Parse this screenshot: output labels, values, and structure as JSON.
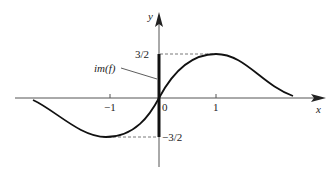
{
  "figure": {
    "axes": {
      "x_label": "x",
      "y_label": "y",
      "x_ticks": [
        {
          "value": -1,
          "label": "−1"
        },
        {
          "value": 0,
          "label": "0"
        },
        {
          "value": 1,
          "label": "1"
        }
      ],
      "y_ticks": [
        {
          "value": 1.5,
          "label": "3/2"
        },
        {
          "value": -1.5,
          "label": "−3/2"
        }
      ]
    },
    "annotation": {
      "label": "im(f)",
      "target": "thick segment on y-axis from −3/2 to 3/2"
    },
    "curve": {
      "max": {
        "x": 1,
        "y": 1.5
      },
      "min": {
        "x": -1,
        "y": -1.5
      },
      "passes_through": {
        "x": 0,
        "y": 0
      }
    },
    "colors": {
      "stroke": "#222222",
      "axis": "#555555",
      "background": "#ffffff"
    }
  },
  "labels": {
    "y_axis": "y",
    "x_axis": "x",
    "tick_pos": "3/2",
    "tick_neg": "−3/2",
    "tick_minus_one": "−1",
    "tick_zero": "0",
    "tick_one": "1",
    "im_f": "im(f)"
  }
}
